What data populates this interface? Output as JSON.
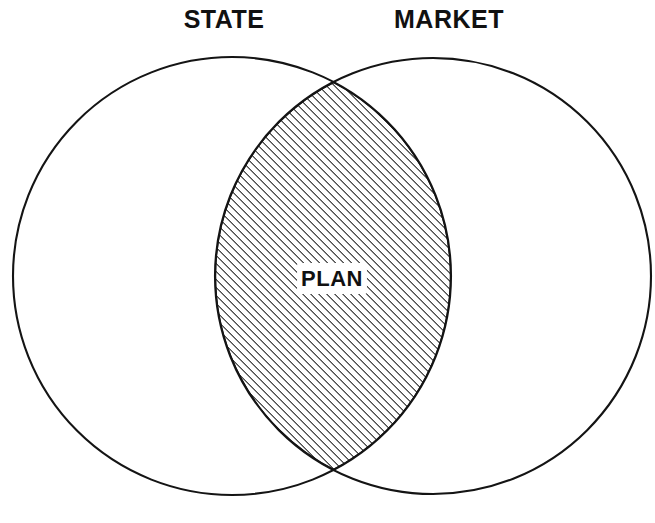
{
  "diagram": {
    "type": "venn",
    "background_color": "#ffffff",
    "stroke_color": "#141414",
    "title": "",
    "sets": [
      {
        "id": "state",
        "label": "STATE",
        "label_x": 224,
        "label_y": 28,
        "cx": 232,
        "cy": 276,
        "r": 219,
        "fill": "none"
      },
      {
        "id": "market",
        "label": "MARKET",
        "label_x": 449,
        "label_y": 28,
        "cx": 433,
        "cy": 276,
        "r": 218,
        "fill": "none"
      }
    ],
    "regions": [
      {
        "id": "intersection",
        "label": "PLAN",
        "label_x": 332,
        "label_y": 286,
        "fill_pattern": "diagonal-hatch",
        "hatch_angle_deg": 45,
        "hatch_spacing_px": 4,
        "hatch_color": "#141414",
        "bounds": {
          "left": 263,
          "right": 400,
          "top": 145,
          "bottom": 412
        }
      }
    ],
    "intersection_points": [
      {
        "x": 331,
        "y": 82
      },
      {
        "x": 333,
        "y": 472
      }
    ]
  }
}
